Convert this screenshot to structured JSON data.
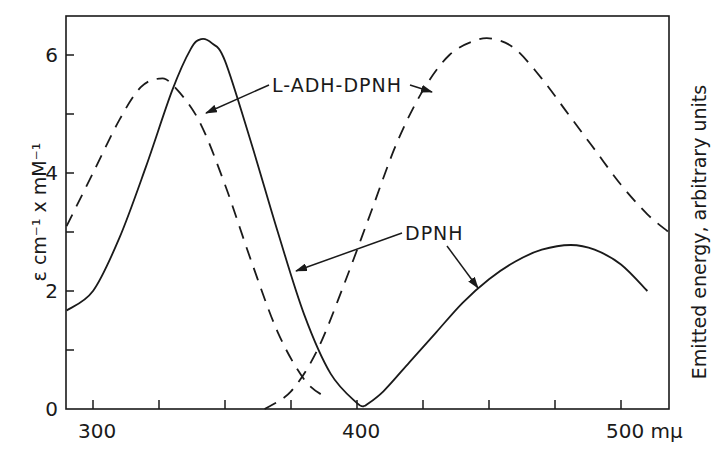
{
  "chart_data": {
    "type": "line",
    "title": "",
    "xlabel": "mμ",
    "ylabel": "ε cm⁻¹ x mM⁻¹",
    "ylabel_right": "Emitted energy, arbitrary units",
    "xlim": [
      290,
      518
    ],
    "ylim": [
      0,
      6.6
    ],
    "x_ticks": [
      300,
      325,
      350,
      375,
      400,
      425,
      450,
      475,
      500
    ],
    "x_tick_labels": [
      {
        "value": 300,
        "label": "300"
      },
      {
        "value": 400,
        "label": "400"
      },
      {
        "value": 500,
        "label": "500 mμ"
      }
    ],
    "y_ticks": [
      0,
      1,
      2,
      3,
      4,
      5,
      6
    ],
    "y_tick_labels": [
      {
        "value": 0,
        "label": "0"
      },
      {
        "value": 2,
        "label": "2"
      },
      {
        "value": 4,
        "label": "4"
      },
      {
        "value": 6,
        "label": "6"
      }
    ],
    "grid": false,
    "legend": null,
    "series": [
      {
        "name": "L-ADH-DPNH absorption",
        "style": "solid",
        "axis": "left",
        "points": [
          [
            290,
            1.67
          ],
          [
            300,
            2.0
          ],
          [
            310,
            2.9
          ],
          [
            320,
            4.1
          ],
          [
            330,
            5.4
          ],
          [
            337,
            6.1
          ],
          [
            341,
            6.27
          ],
          [
            345,
            6.2
          ],
          [
            350,
            5.9
          ],
          [
            360,
            4.5
          ],
          [
            370,
            3.0
          ],
          [
            380,
            1.6
          ],
          [
            390,
            0.6
          ],
          [
            400,
            0.1
          ],
          [
            403,
            0.05
          ]
        ]
      },
      {
        "name": "L-ADH-DPNH emission",
        "style": "solid",
        "axis": "right",
        "points": [
          [
            403,
            0.05
          ],
          [
            410,
            0.3
          ],
          [
            420,
            0.8
          ],
          [
            430,
            1.3
          ],
          [
            440,
            1.8
          ],
          [
            450,
            2.2
          ],
          [
            460,
            2.5
          ],
          [
            470,
            2.7
          ],
          [
            481,
            2.78
          ],
          [
            490,
            2.7
          ],
          [
            500,
            2.45
          ],
          [
            510,
            2.0
          ]
        ]
      },
      {
        "name": "DPNH absorption",
        "style": "dashed",
        "axis": "left",
        "points": [
          [
            290,
            3.1
          ],
          [
            300,
            4.0
          ],
          [
            310,
            4.9
          ],
          [
            318,
            5.45
          ],
          [
            325,
            5.6
          ],
          [
            330,
            5.5
          ],
          [
            340,
            4.9
          ],
          [
            350,
            3.8
          ],
          [
            360,
            2.5
          ],
          [
            370,
            1.3
          ],
          [
            380,
            0.5
          ],
          [
            388,
            0.2
          ]
        ]
      },
      {
        "name": "DPNH emission",
        "style": "dashed",
        "axis": "right",
        "points": [
          [
            365,
            0
          ],
          [
            375,
            0.3
          ],
          [
            385,
            1.0
          ],
          [
            395,
            2.1
          ],
          [
            405,
            3.3
          ],
          [
            415,
            4.5
          ],
          [
            425,
            5.4
          ],
          [
            435,
            6.0
          ],
          [
            445,
            6.25
          ],
          [
            452,
            6.27
          ],
          [
            460,
            6.1
          ],
          [
            470,
            5.6
          ],
          [
            480,
            5.0
          ],
          [
            490,
            4.4
          ],
          [
            500,
            3.8
          ],
          [
            510,
            3.3
          ],
          [
            518,
            3.0
          ]
        ]
      }
    ],
    "annotations": [
      {
        "text": "L-ADH-DPNH",
        "x": 272,
        "y": 92,
        "arrows_to": [
          [
            206,
            113
          ],
          [
            432,
            92
          ]
        ]
      },
      {
        "text": "DPNH",
        "x": 405,
        "y": 240,
        "arrows_to": [
          [
            296,
            271
          ],
          [
            478,
            288
          ]
        ]
      }
    ]
  },
  "colors": {
    "ink": "#1a1a1a",
    "background": "#ffffff"
  }
}
